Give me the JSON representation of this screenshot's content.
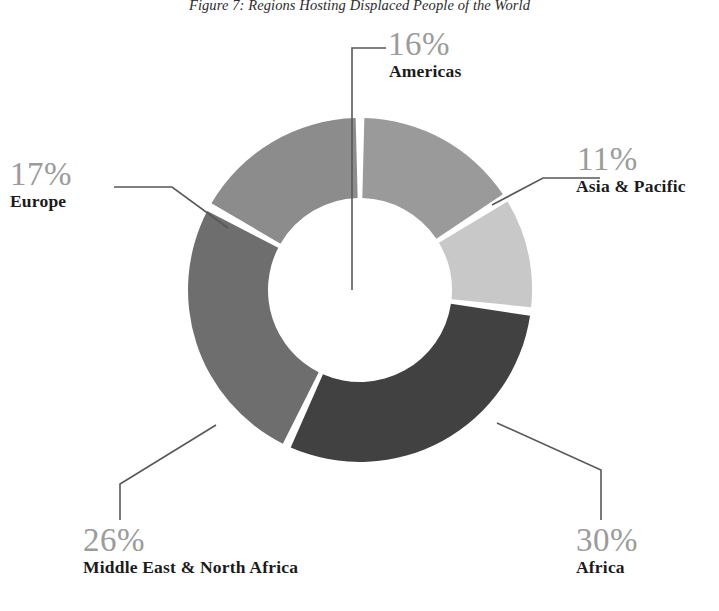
{
  "figure": {
    "title": "Figure 7: Regions Hosting Displaced People of the World"
  },
  "chart_data": {
    "type": "pie",
    "variant": "donut",
    "title": "Figure 7: Regions Hosting Displaced People of the World",
    "xlabel": "",
    "ylabel": "",
    "units": "percent",
    "total": 100,
    "legend": "none",
    "grid": false,
    "labels_inline": true,
    "categories": [
      "Americas",
      "Asia & Pacific",
      "Africa",
      "Middle East & North Africa",
      "Europe"
    ],
    "values": [
      16,
      11,
      30,
      26,
      17
    ],
    "value_labels": [
      "16%",
      "11%",
      "30%",
      "26%",
      "17%"
    ],
    "colors": [
      "#9a9a9a",
      "#c8c8c8",
      "#414141",
      "#6e6e6e",
      "#8c8c8c"
    ],
    "slice_order": "clockwise from 12 o'clock",
    "slices": [
      {
        "name": "Americas",
        "value": 16,
        "value_label": "16%",
        "color": "#9a9a9a"
      },
      {
        "name": "Asia & Pacific",
        "value": 11,
        "value_label": "11%",
        "color": "#c8c8c8"
      },
      {
        "name": "Africa",
        "value": 30,
        "value_label": "30%",
        "color": "#414141"
      },
      {
        "name": "Middle East & North Africa",
        "value": 26,
        "value_label": "26%",
        "color": "#6e6e6e"
      },
      {
        "name": "Europe",
        "value": 17,
        "value_label": "17%",
        "color": "#8c8c8c"
      }
    ]
  },
  "callouts": {
    "americas": {
      "pct": "16%",
      "label": "Americas"
    },
    "asia_pacific": {
      "pct": "11%",
      "label": "Asia & Pacific"
    },
    "europe": {
      "pct": "17%",
      "label": "Europe"
    },
    "mena": {
      "pct": "26%",
      "label": "Middle East & North Africa"
    },
    "africa": {
      "pct": "30%",
      "label": "Africa"
    }
  },
  "style": {
    "background": "#ffffff",
    "leader_line_color": "#58585a",
    "percent_text_color": "#9b9b9b",
    "label_text_color": "#1b1b1b",
    "slice_gap_color": "#ffffff"
  }
}
